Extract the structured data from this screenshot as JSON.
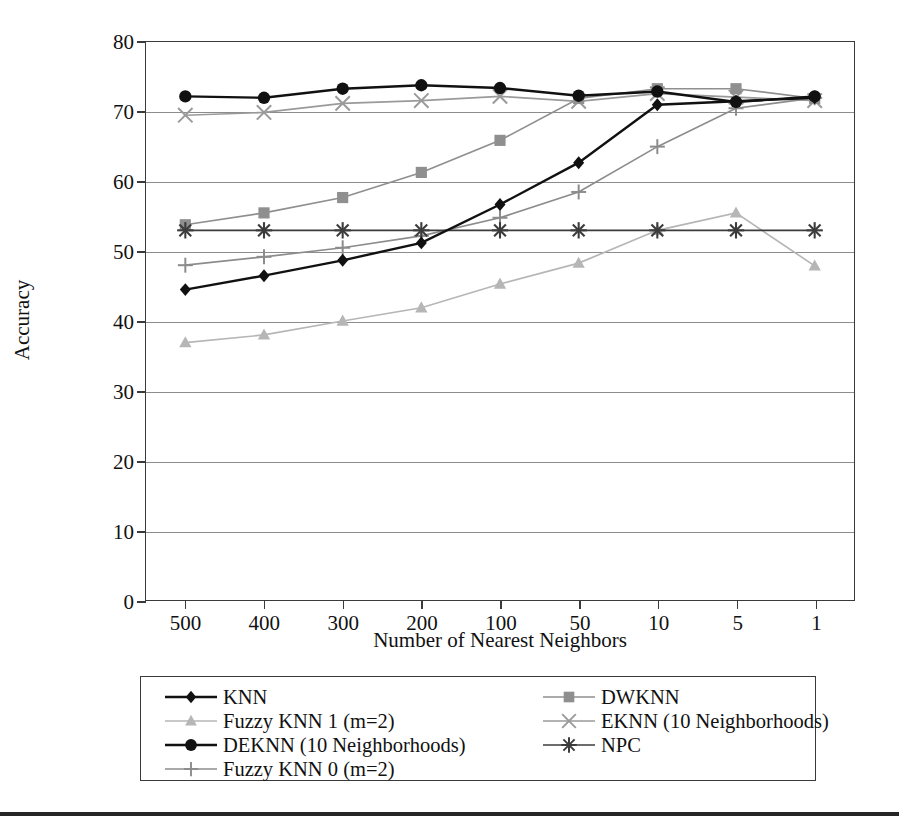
{
  "chart_data": {
    "type": "line",
    "title": "",
    "xlabel": "Number of Nearest Neighbors",
    "ylabel": "Accuracy",
    "categories": [
      "500",
      "400",
      "300",
      "200",
      "100",
      "50",
      "10",
      "5",
      "1"
    ],
    "ylim": [
      0,
      80
    ],
    "yticks": [
      "0",
      "10",
      "20",
      "30",
      "40",
      "50",
      "60",
      "70",
      "80"
    ],
    "grid": true,
    "legend_position": "bottom",
    "series": [
      {
        "name": "KNN",
        "marker": "diamond",
        "color": "#111111",
        "values": [
          44.5,
          46.5,
          48.7,
          51.2,
          56.7,
          62.7,
          71.0,
          71.5,
          72.0
        ]
      },
      {
        "name": "DWKNN",
        "marker": "square",
        "color": "#8f8f8f",
        "values": [
          53.8,
          55.5,
          57.7,
          61.3,
          65.9,
          71.9,
          73.3,
          73.3,
          71.9
        ]
      },
      {
        "name": "Fuzzy KNN 1 (m=2)",
        "marker": "triangle",
        "color": "#b6b6b6",
        "values": [
          36.9,
          38.0,
          40.0,
          41.9,
          45.3,
          48.3,
          53.0,
          55.5,
          47.9
        ]
      },
      {
        "name": "EKNN (10 Neighborhoods)",
        "marker": "cross-x",
        "color": "#9a9a9a",
        "values": [
          69.5,
          69.9,
          71.2,
          71.6,
          72.2,
          71.5,
          72.6,
          72.1,
          71.6
        ]
      },
      {
        "name": "DEKNN (10 Neighborhoods)",
        "marker": "circle",
        "color": "#111111",
        "values": [
          72.2,
          72.0,
          73.3,
          73.8,
          73.4,
          72.3,
          72.9,
          71.4,
          72.2
        ]
      },
      {
        "name": "NPC",
        "marker": "asterisk",
        "color": "#3c3c3c",
        "values": [
          53.0,
          53.0,
          53.0,
          53.0,
          53.0,
          53.0,
          53.0,
          53.0,
          53.0
        ]
      },
      {
        "name": "Fuzzy KNN 0 (m=2)",
        "marker": "plus",
        "color": "#8c8c8c",
        "values": [
          48.0,
          49.2,
          50.5,
          52.2,
          54.8,
          58.5,
          65.0,
          70.5,
          72.0
        ]
      }
    ]
  },
  "axes": {
    "y_title": "Accuracy",
    "x_title": "Number of Nearest Neighbors"
  },
  "legend": {
    "left_column": [
      {
        "label": "KNN",
        "series": "KNN"
      },
      {
        "label": "Fuzzy KNN 1 (m=2)",
        "series": "Fuzzy KNN 1 (m=2)"
      },
      {
        "label": "DEKNN (10 Neighborhoods)",
        "series": "DEKNN (10 Neighborhoods)"
      },
      {
        "label": "Fuzzy KNN 0 (m=2)",
        "series": "Fuzzy KNN 0 (m=2)"
      }
    ],
    "right_column": [
      {
        "label": "DWKNN",
        "series": "DWKNN"
      },
      {
        "label": "EKNN (10 Neighborhoods)",
        "series": "EKNN (10 Neighborhoods)"
      },
      {
        "label": "NPC",
        "series": "NPC"
      }
    ]
  },
  "colors": {
    "axis": "#3a3a3a",
    "grid": "#8c8c8c",
    "text": "#111111",
    "background": "#ffffff",
    "rule": "#262626"
  }
}
